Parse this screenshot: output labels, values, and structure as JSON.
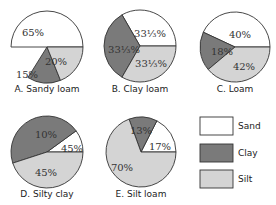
{
  "colors": {
    "sand": "#ffffff",
    "clay": "#7a7a7a",
    "silt": "#d4d4d4",
    "stroke": "#333333"
  },
  "legend": [
    {
      "key": "sand",
      "label": "Sand"
    },
    {
      "key": "clay",
      "label": "Clay"
    },
    {
      "key": "silt",
      "label": "Silt"
    }
  ],
  "chart_data": [
    {
      "type": "pie",
      "title": "A. Sandy loam",
      "labels": [
        "Sand",
        "Clay",
        "Silt"
      ],
      "values": [
        65,
        15,
        20
      ],
      "display": [
        "65%",
        "15%",
        "20%"
      ]
    },
    {
      "type": "pie",
      "title": "B. Clay loam",
      "labels": [
        "Sand",
        "Clay",
        "Silt"
      ],
      "values": [
        33.33,
        33.33,
        33.33
      ],
      "display": [
        "33⅓%",
        "33⅓%",
        "33⅓%"
      ]
    },
    {
      "type": "pie",
      "title": "C. Loam",
      "labels": [
        "Sand",
        "Clay",
        "Silt"
      ],
      "values": [
        40,
        18,
        42
      ],
      "display": [
        "40%",
        "18%",
        "42%"
      ]
    },
    {
      "type": "pie",
      "title": "D. Silty clay",
      "labels": [
        "Sand",
        "Clay",
        "Silt"
      ],
      "values": [
        10,
        45,
        45
      ],
      "display": [
        "10%",
        "45%",
        "45%"
      ]
    },
    {
      "type": "pie",
      "title": "E. Silt loam",
      "labels": [
        "Sand",
        "Clay",
        "Silt"
      ],
      "values": [
        17,
        13,
        70
      ],
      "display": [
        "17%",
        "13%",
        "70%"
      ]
    }
  ]
}
